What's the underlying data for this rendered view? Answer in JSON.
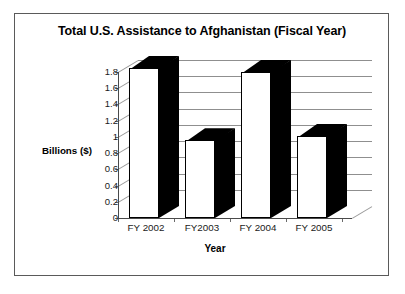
{
  "figure": {
    "background_color": "#ffffff",
    "frame_color": "#5a5a5a"
  },
  "chart_data": {
    "type": "bar",
    "title": "Total U.S. Assistance to Afghanistan (Fiscal Year)",
    "xlabel": "Year",
    "ylabel": "Billions ($)",
    "categories": [
      "FY 2002",
      "FY2003",
      "FY 2004",
      "FY 2005"
    ],
    "values": [
      1.85,
      0.96,
      1.8,
      1.01
    ],
    "ylim": [
      0,
      1.8
    ],
    "yticks": [
      "0",
      "0.2",
      "0.4",
      "0.6",
      "0.8",
      "1",
      "1.2",
      "1.4",
      "1.6",
      "1.8"
    ],
    "ytick_values": [
      0,
      0.2,
      0.4,
      0.6,
      0.8,
      1.0,
      1.2,
      1.4,
      1.6,
      1.8
    ],
    "grid": true,
    "legend": null,
    "style": "3d-column",
    "bar_face_color": "#ffffff",
    "bar_edge_color": "#000000",
    "bar_shadow_color": "#000000",
    "gridline_color": "#8f8f8f"
  }
}
